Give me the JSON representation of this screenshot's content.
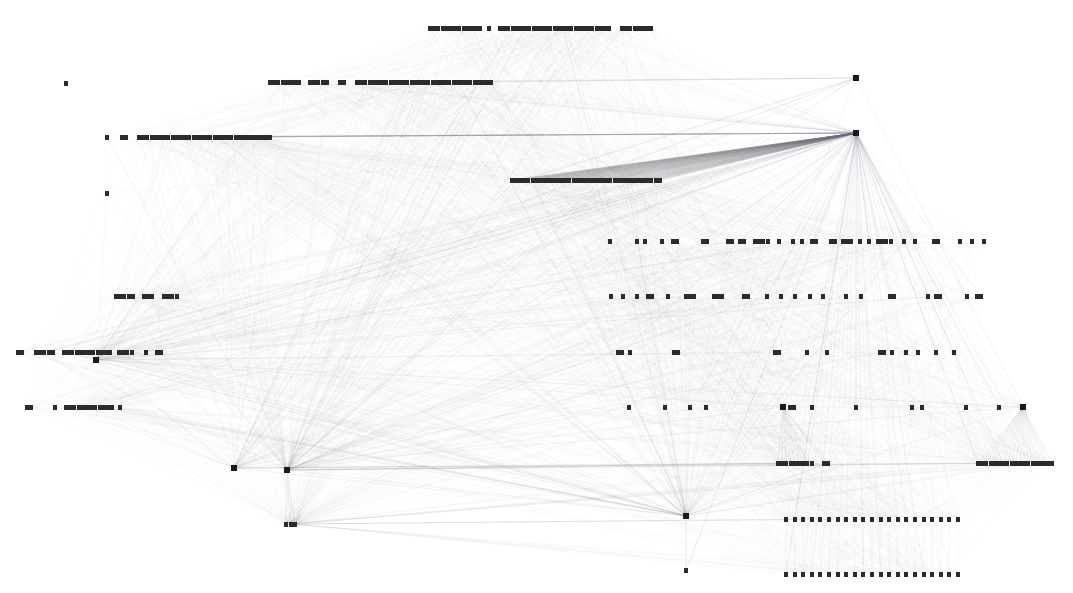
{
  "figure": {
    "kind": "network-graph",
    "title": "",
    "width": 1073,
    "height": 593,
    "background_color": "#ffffff"
  },
  "style": {
    "node_color": "#2b2b2b",
    "node_width": 4,
    "node_height": 5,
    "edge_color": "#8c8c96",
    "edge_opacity": 0.16,
    "edge_width": 0.4,
    "hub_node_color": "#1a1a1a",
    "hub_node_width": 6,
    "hub_node_height": 6
  },
  "chart_data": {
    "type": "scatter",
    "title": "",
    "xlabel": "",
    "ylabel": "",
    "xlim": [
      0,
      1073
    ],
    "ylim": [
      0,
      593
    ],
    "grid": false,
    "legend": "none",
    "node_rows": [
      {
        "name": "row-1",
        "y": 28,
        "segments": [
          {
            "start": 430,
            "count": 13,
            "step": 4.2
          },
          {
            "start": 489,
            "count": 1,
            "step": 4.2
          },
          {
            "start": 500,
            "count": 27,
            "step": 4.2
          },
          {
            "start": 622,
            "count": 8,
            "step": 4.2
          }
        ]
      },
      {
        "name": "row-2",
        "y": 82,
        "segments": [
          {
            "start": 270,
            "count": 8,
            "step": 4.2
          },
          {
            "start": 310,
            "count": 5,
            "step": 4.2
          },
          {
            "start": 340,
            "count": 2,
            "step": 4.2
          },
          {
            "start": 357,
            "count": 33,
            "step": 4.2
          },
          {
            "start": 478,
            "count": 1,
            "step": 4.2
          }
        ]
      },
      {
        "name": "row-3",
        "y": 137,
        "segments": [
          {
            "start": 107,
            "count": 1,
            "step": 4.2
          },
          {
            "start": 122,
            "count": 2,
            "step": 4.2
          },
          {
            "start": 139,
            "count": 30,
            "step": 4.2
          },
          {
            "start": 270,
            "count": 1,
            "step": 4.2
          },
          {
            "start": 252,
            "count": 5,
            "step": 4.2
          }
        ]
      },
      {
        "name": "row-4",
        "y": 180,
        "segments": [
          {
            "start": 512,
            "count": 37,
            "step": 4.1
          }
        ]
      },
      {
        "name": "row-5",
        "y": 241,
        "segments": [
          {
            "start": 610,
            "count": 1,
            "step": 4.2
          },
          {
            "start": 637,
            "count": 1,
            "step": 4.2
          },
          {
            "start": 645,
            "count": 1,
            "step": 4.2
          },
          {
            "start": 662,
            "count": 1,
            "step": 4.2
          },
          {
            "start": 673,
            "count": 2,
            "step": 4.2
          },
          {
            "start": 703,
            "count": 2,
            "step": 4.2
          },
          {
            "start": 728,
            "count": 2,
            "step": 4.2
          },
          {
            "start": 740,
            "count": 2,
            "step": 4.2
          },
          {
            "start": 755,
            "count": 4,
            "step": 4.2
          },
          {
            "start": 779,
            "count": 1,
            "step": 4.2
          },
          {
            "start": 793,
            "count": 1,
            "step": 4.2
          },
          {
            "start": 802,
            "count": 1,
            "step": 4.2
          },
          {
            "start": 812,
            "count": 2,
            "step": 4.2
          },
          {
            "start": 831,
            "count": 2,
            "step": 4.2
          },
          {
            "start": 843,
            "count": 3,
            "step": 4.2
          },
          {
            "start": 860,
            "count": 1,
            "step": 4.2
          },
          {
            "start": 869,
            "count": 1,
            "step": 4.2
          },
          {
            "start": 878,
            "count": 4,
            "step": 4.2
          },
          {
            "start": 904,
            "count": 1,
            "step": 4.2
          },
          {
            "start": 915,
            "count": 1,
            "step": 4.2
          },
          {
            "start": 934,
            "count": 2,
            "step": 4.2
          },
          {
            "start": 960,
            "count": 1,
            "step": 4.2
          },
          {
            "start": 972,
            "count": 1,
            "step": 4.2
          },
          {
            "start": 984,
            "count": 1,
            "step": 4.2
          }
        ]
      },
      {
        "name": "row-6",
        "y": 296,
        "segments": [
          {
            "start": 116,
            "count": 5,
            "step": 4.2
          },
          {
            "start": 144,
            "count": 3,
            "step": 4.2
          },
          {
            "start": 164,
            "count": 4,
            "step": 4.2
          },
          {
            "start": 611,
            "count": 1,
            "step": 4.2
          },
          {
            "start": 623,
            "count": 1,
            "step": 4.2
          },
          {
            "start": 637,
            "count": 1,
            "step": 4.2
          },
          {
            "start": 648,
            "count": 2,
            "step": 4.2
          },
          {
            "start": 668,
            "count": 1,
            "step": 4.2
          },
          {
            "start": 686,
            "count": 3,
            "step": 4.2
          },
          {
            "start": 714,
            "count": 3,
            "step": 4.2
          },
          {
            "start": 744,
            "count": 2,
            "step": 4.2
          },
          {
            "start": 767,
            "count": 1,
            "step": 4.2
          },
          {
            "start": 781,
            "count": 1,
            "step": 4.2
          },
          {
            "start": 795,
            "count": 1,
            "step": 4.2
          },
          {
            "start": 810,
            "count": 1,
            "step": 4.2
          },
          {
            "start": 823,
            "count": 1,
            "step": 4.2
          },
          {
            "start": 846,
            "count": 1,
            "step": 4.2
          },
          {
            "start": 861,
            "count": 1,
            "step": 4.2
          },
          {
            "start": 890,
            "count": 2,
            "step": 4.2
          },
          {
            "start": 928,
            "count": 1,
            "step": 4.2
          },
          {
            "start": 936,
            "count": 2,
            "step": 4.2
          },
          {
            "start": 967,
            "count": 1,
            "step": 4.2
          },
          {
            "start": 977,
            "count": 2,
            "step": 4.2
          }
        ]
      },
      {
        "name": "row-7",
        "y": 352,
        "segments": [
          {
            "start": 18,
            "count": 2,
            "step": 4.2
          },
          {
            "start": 36,
            "count": 5,
            "step": 4.2
          },
          {
            "start": 64,
            "count": 12,
            "step": 4.2
          },
          {
            "start": 119,
            "count": 4,
            "step": 4.2
          },
          {
            "start": 146,
            "count": 1,
            "step": 4.2
          },
          {
            "start": 157,
            "count": 2,
            "step": 4.2
          },
          {
            "start": 618,
            "count": 2,
            "step": 4.2
          },
          {
            "start": 630,
            "count": 1,
            "step": 4.2
          },
          {
            "start": 674,
            "count": 2,
            "step": 4.2
          },
          {
            "start": 775,
            "count": 2,
            "step": 4.2
          },
          {
            "start": 807,
            "count": 1,
            "step": 4.2
          },
          {
            "start": 827,
            "count": 1,
            "step": 4.2
          },
          {
            "start": 880,
            "count": 2,
            "step": 4.2
          },
          {
            "start": 892,
            "count": 1,
            "step": 4.2
          },
          {
            "start": 906,
            "count": 1,
            "step": 4.2
          },
          {
            "start": 918,
            "count": 1,
            "step": 4.2
          },
          {
            "start": 936,
            "count": 1,
            "step": 4.2
          },
          {
            "start": 954,
            "count": 1,
            "step": 4.2
          }
        ]
      },
      {
        "name": "row-8",
        "y": 407,
        "segments": [
          {
            "start": 27,
            "count": 2,
            "step": 4.2
          },
          {
            "start": 55,
            "count": 1,
            "step": 4.2
          },
          {
            "start": 66,
            "count": 12,
            "step": 4.2
          },
          {
            "start": 120,
            "count": 1,
            "step": 4.2
          },
          {
            "start": 629,
            "count": 1,
            "step": 4.2
          },
          {
            "start": 665,
            "count": 1,
            "step": 4.2
          },
          {
            "start": 690,
            "count": 1,
            "step": 4.2
          },
          {
            "start": 706,
            "count": 1,
            "step": 4.2
          },
          {
            "start": 790,
            "count": 2,
            "step": 4.2
          },
          {
            "start": 812,
            "count": 1,
            "step": 4.2
          },
          {
            "start": 856,
            "count": 1,
            "step": 4.2
          },
          {
            "start": 912,
            "count": 1,
            "step": 4.2
          },
          {
            "start": 922,
            "count": 1,
            "step": 4.2
          },
          {
            "start": 966,
            "count": 1,
            "step": 4.2
          },
          {
            "start": 999,
            "count": 1,
            "step": 4.2
          }
        ]
      },
      {
        "name": "row-9",
        "y": 463,
        "segments": [
          {
            "start": 778,
            "count": 9,
            "step": 4.2
          },
          {
            "start": 824,
            "count": 2,
            "step": 4.2
          },
          {
            "start": 978,
            "count": 17,
            "step": 4.2
          },
          {
            "start": 1048,
            "count": 2,
            "step": 4.2
          }
        ]
      },
      {
        "name": "row-10-ladder-top",
        "y": 519,
        "segments": [
          {
            "start": 786,
            "count": 21,
            "step": 8.6
          }
        ]
      },
      {
        "name": "row-11-ladder-bottom",
        "y": 574,
        "segments": [
          {
            "start": 786,
            "count": 21,
            "step": 8.6
          }
        ]
      },
      {
        "name": "row-small-left",
        "y": 524,
        "segments": [
          {
            "start": 286,
            "count": 3,
            "step": 4.6
          }
        ]
      }
    ],
    "isolated_nodes": [
      {
        "x": 66,
        "y": 83
      },
      {
        "x": 107,
        "y": 193
      },
      {
        "x": 478,
        "y": 82
      },
      {
        "x": 686,
        "y": 570
      }
    ],
    "hub_nodes": [
      {
        "id": "hub-right-top",
        "x": 856,
        "y": 133,
        "degree": 210,
        "label": ""
      },
      {
        "id": "hub-left-lower",
        "x": 234,
        "y": 468,
        "degree": 70,
        "label": ""
      },
      {
        "id": "hub-left-lower-2",
        "x": 287,
        "y": 470,
        "degree": 110,
        "label": ""
      },
      {
        "id": "hub-bottom-center",
        "x": 686,
        "y": 516,
        "degree": 95,
        "label": ""
      },
      {
        "id": "hub-right-mid",
        "x": 783,
        "y": 407,
        "degree": 45,
        "label": ""
      },
      {
        "id": "hub-right-far",
        "x": 1023,
        "y": 407,
        "degree": 40,
        "label": ""
      },
      {
        "id": "hub-left-upper",
        "x": 96,
        "y": 360,
        "degree": 55,
        "label": ""
      },
      {
        "id": "hub-top-left",
        "x": 856,
        "y": 78,
        "degree": 6,
        "label": ""
      }
    ]
  }
}
